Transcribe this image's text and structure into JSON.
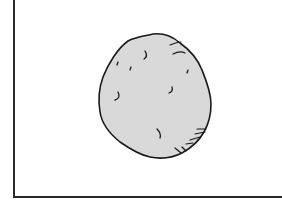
{
  "figure": {
    "fill_color": "#d9d9d9",
    "stroke_color": "#1a1a1a",
    "frame_color": "#2a2a2a"
  }
}
